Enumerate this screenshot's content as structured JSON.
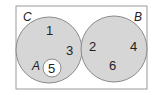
{
  "diagram": {
    "type": "venn",
    "universe": {
      "label": "C",
      "elements_outside_sets": []
    },
    "sets": [
      {
        "label": "C",
        "elements": [
          "1",
          "3"
        ],
        "subset": {
          "label": "A",
          "elements": [
            "5"
          ]
        }
      },
      {
        "label": "B",
        "elements": [
          "2",
          "4",
          "6"
        ]
      }
    ],
    "labels": {
      "C": "C",
      "B": "B",
      "A": "A"
    },
    "numbers": {
      "n1": "1",
      "n3": "3",
      "n5": "5",
      "n2": "2",
      "n4": "4",
      "n6": "6"
    },
    "colors": {
      "border": "#9a9a9a",
      "circle_fill": "#d6d6d6",
      "circle_stroke": "#8a8a8a",
      "inner_fill": "#ffffff"
    }
  }
}
